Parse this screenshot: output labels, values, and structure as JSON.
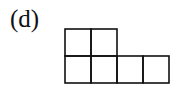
{
  "label": "(d)",
  "diagram": {
    "type": "young-diagram",
    "rows": [
      2,
      4
    ],
    "cell_size": 26,
    "origin": {
      "x": 65,
      "y": 29
    },
    "stroke": "#111111",
    "stroke_width": 1.6
  }
}
